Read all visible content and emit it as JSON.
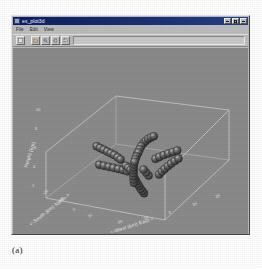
{
  "figure": {
    "caption": "(a)"
  },
  "window": {
    "title": "ex_plot3d",
    "system_icon": "window-system-icon",
    "buttons": [
      {
        "name": "minimize-button",
        "label": "_"
      },
      {
        "name": "maximize-button",
        "label": "□"
      },
      {
        "name": "close-button",
        "label": "×"
      }
    ]
  },
  "menubar": {
    "items": [
      {
        "label": "File"
      },
      {
        "label": "Edit"
      },
      {
        "label": "View"
      }
    ]
  },
  "toolbar": {
    "buttons": [
      {
        "name": "new-button",
        "icon": "document-icon"
      },
      {
        "name": "open-button",
        "icon": "folder-icon"
      },
      {
        "name": "zoom-button",
        "icon": "magnifier-icon"
      },
      {
        "name": "rotate-button",
        "icon": "rotate-icon"
      },
      {
        "name": "print-button",
        "icon": "printer-icon"
      }
    ],
    "field_value": ""
  },
  "colors": {
    "plot_background": "#8b8b8b",
    "window_face": "#bdbdbd",
    "titlebar": "#0b1f63",
    "axis_line": "#d5d5d5",
    "marker_fill": "#4e4e4e",
    "marker_highlight": "#9a9a9a",
    "text_light": "#e9e9e9",
    "page_background": "#ffffff"
  },
  "chart_data": {
    "type": "scatter",
    "projection": "3d",
    "title": "",
    "xlabel": "<-West (km) East->",
    "ylabel": "<-South (km) North->",
    "zlabel": "Height (km)",
    "xticks": [
      "-20",
      "-10",
      "0",
      "10",
      "20"
    ],
    "yticks": [
      "-20",
      "-10",
      "0",
      "10",
      "20"
    ],
    "zticks": [
      "2",
      "4",
      "6",
      "8",
      "10"
    ],
    "xlim": [
      -25,
      25
    ],
    "ylim": [
      -25,
      25
    ],
    "zlim": [
      0,
      11
    ],
    "grid": false,
    "legend": "none",
    "marker": "sphere",
    "marker_color": "#4e4e4e",
    "series": [
      {
        "name": "branch-1-north-upper",
        "points": [
          {
            "x": 2.0,
            "y": 6.0,
            "z": 9.6
          },
          {
            "x": 1.2,
            "y": 5.4,
            "z": 9.4
          },
          {
            "x": 0.4,
            "y": 4.8,
            "z": 9.1
          },
          {
            "x": -0.3,
            "y": 4.2,
            "z": 8.7
          },
          {
            "x": -1.0,
            "y": 3.6,
            "z": 8.2
          },
          {
            "x": -1.5,
            "y": 3.0,
            "z": 7.6
          },
          {
            "x": -1.8,
            "y": 2.4,
            "z": 7.0
          },
          {
            "x": -2.0,
            "y": 1.8,
            "z": 6.4
          }
        ]
      },
      {
        "name": "branch-2-west-arm",
        "points": [
          {
            "x": -19.0,
            "y": 1.0,
            "z": 6.3
          },
          {
            "x": -17.4,
            "y": 0.8,
            "z": 6.1
          },
          {
            "x": -15.8,
            "y": 0.6,
            "z": 5.9
          },
          {
            "x": -14.2,
            "y": 0.4,
            "z": 5.7
          },
          {
            "x": -12.6,
            "y": 0.2,
            "z": 5.5
          },
          {
            "x": -11.0,
            "y": 0.0,
            "z": 5.3
          },
          {
            "x": -9.4,
            "y": -0.3,
            "z": 5.0
          },
          {
            "x": -8.0,
            "y": -0.6,
            "z": 4.7
          }
        ]
      },
      {
        "name": "branch-3-southwest-arm",
        "points": [
          {
            "x": -13.5,
            "y": -6.5,
            "z": 4.4
          },
          {
            "x": -11.8,
            "y": -6.0,
            "z": 4.2
          },
          {
            "x": -10.1,
            "y": -5.5,
            "z": 4.0
          },
          {
            "x": -8.4,
            "y": -5.0,
            "z": 3.8
          },
          {
            "x": -6.7,
            "y": -4.5,
            "z": 3.6
          },
          {
            "x": -5.0,
            "y": -4.0,
            "z": 3.4
          },
          {
            "x": -3.5,
            "y": -3.5,
            "z": 3.1
          }
        ]
      },
      {
        "name": "branch-4-central-trunk",
        "points": [
          {
            "x": -2.2,
            "y": 1.4,
            "z": 6.1
          },
          {
            "x": -2.3,
            "y": 0.9,
            "z": 5.6
          },
          {
            "x": -2.4,
            "y": 0.4,
            "z": 5.1
          },
          {
            "x": -2.4,
            "y": -0.1,
            "z": 4.6
          },
          {
            "x": -2.3,
            "y": -0.7,
            "z": 4.1
          },
          {
            "x": -2.1,
            "y": -1.3,
            "z": 3.6
          },
          {
            "x": -1.8,
            "y": -1.9,
            "z": 3.1
          },
          {
            "x": -1.4,
            "y": -2.6,
            "z": 2.6
          },
          {
            "x": -1.0,
            "y": -3.3,
            "z": 2.1
          },
          {
            "x": -0.5,
            "y": -4.1,
            "z": 1.6
          },
          {
            "x": 0.1,
            "y": -4.9,
            "z": 1.1
          }
        ]
      },
      {
        "name": "branch-5-east-upper",
        "points": [
          {
            "x": 12.0,
            "y": 5.8,
            "z": 7.3
          },
          {
            "x": 10.6,
            "y": 5.0,
            "z": 7.0
          },
          {
            "x": 9.2,
            "y": 4.2,
            "z": 6.7
          },
          {
            "x": 7.8,
            "y": 3.4,
            "z": 6.4
          },
          {
            "x": 6.4,
            "y": 2.6,
            "z": 6.0
          },
          {
            "x": 5.2,
            "y": 1.9,
            "z": 5.6
          }
        ]
      },
      {
        "name": "branch-6-east-lower",
        "points": [
          {
            "x": 14.5,
            "y": 2.4,
            "z": 6.5
          },
          {
            "x": 13.4,
            "y": 1.6,
            "z": 6.0
          },
          {
            "x": 12.4,
            "y": 0.8,
            "z": 5.5
          },
          {
            "x": 11.5,
            "y": 0.0,
            "z": 5.0
          },
          {
            "x": 10.7,
            "y": -0.9,
            "z": 4.5
          },
          {
            "x": 10.0,
            "y": -1.8,
            "z": 4.0
          },
          {
            "x": 9.4,
            "y": -2.7,
            "z": 3.5
          }
        ]
      },
      {
        "name": "branch-7-south-descending",
        "points": [
          {
            "x": 1.0,
            "y": -5.6,
            "z": 2.3
          },
          {
            "x": 2.0,
            "y": -6.4,
            "z": 2.0
          },
          {
            "x": 3.0,
            "y": -7.2,
            "z": 1.7
          },
          {
            "x": 4.1,
            "y": -8.0,
            "z": 1.5
          },
          {
            "x": 5.2,
            "y": -8.8,
            "z": 1.2
          },
          {
            "x": 6.4,
            "y": -9.6,
            "z": 1.0
          },
          {
            "x": 7.6,
            "y": -10.4,
            "z": 0.8
          }
        ]
      },
      {
        "name": "branch-8-midlevel-cluster",
        "points": [
          {
            "x": -5.0,
            "y": -2.0,
            "z": 3.9
          },
          {
            "x": -3.8,
            "y": -2.3,
            "z": 3.6
          },
          {
            "x": -2.6,
            "y": -2.6,
            "z": 3.3
          },
          {
            "x": 2.6,
            "y": -2.2,
            "z": 3.8
          },
          {
            "x": 4.0,
            "y": -2.8,
            "z": 3.4
          },
          {
            "x": 5.4,
            "y": -3.4,
            "z": 3.0
          }
        ]
      }
    ]
  }
}
